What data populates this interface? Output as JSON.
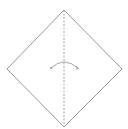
{
  "diagram": {
    "type": "origami-step",
    "description": "Square paper oriented as a diamond with a vertical valley-fold line and a curved fold arrow",
    "colors": {
      "background": "#ffffff",
      "outline": "#8c8c8c",
      "fold_line": "#9a9a9a",
      "arrow": "#8c8c8c"
    },
    "shape": {
      "name": "diamond-square",
      "vertices": {
        "top": [
          64,
          10
        ],
        "right": [
          122,
          69
        ],
        "bottom": [
          64,
          127
        ],
        "left": [
          7,
          69
        ]
      }
    },
    "fold_line": {
      "style": "dashed",
      "kind": "valley-fold",
      "from": [
        64,
        10
      ],
      "to": [
        64,
        127
      ]
    },
    "arrow": {
      "kind": "curved-fold-arrow",
      "from": [
        51,
        68
      ],
      "peak": [
        64,
        61
      ],
      "to": [
        78,
        68
      ]
    }
  }
}
